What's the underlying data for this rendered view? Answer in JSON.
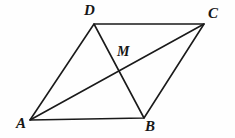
{
  "figure": {
    "kind": "parallelogram-with-diagonals",
    "background_color": "#fefefe",
    "stroke_color": "#1a1a1a",
    "stroke_width": 1.6,
    "width": 235,
    "height": 138,
    "points": {
      "A": {
        "label": "A",
        "x": 30,
        "y": 120
      },
      "B": {
        "label": "B",
        "x": 144,
        "y": 118
      },
      "C": {
        "label": "C",
        "x": 204,
        "y": 24
      },
      "D": {
        "label": "D",
        "x": 94,
        "y": 24
      },
      "M": {
        "label": "M",
        "x": 117,
        "y": 73
      }
    },
    "segments": [
      {
        "name": "side-AB",
        "from": "A",
        "to": "B"
      },
      {
        "name": "side-BC",
        "from": "B",
        "to": "C"
      },
      {
        "name": "side-CD",
        "from": "C",
        "to": "D"
      },
      {
        "name": "side-DA",
        "from": "D",
        "to": "A"
      },
      {
        "name": "diagonal-AC",
        "from": "A",
        "to": "C"
      },
      {
        "name": "diagonal-DB",
        "from": "D",
        "to": "B"
      }
    ],
    "polyline_sides": "30,120 144,118 204,24 94,24 30,120",
    "diagonal_ac": {
      "x1": 30,
      "y1": 120,
      "x2": 204,
      "y2": 24
    },
    "diagonal_db": {
      "x1": 94,
      "y1": 24,
      "x2": 144,
      "y2": 118
    }
  }
}
